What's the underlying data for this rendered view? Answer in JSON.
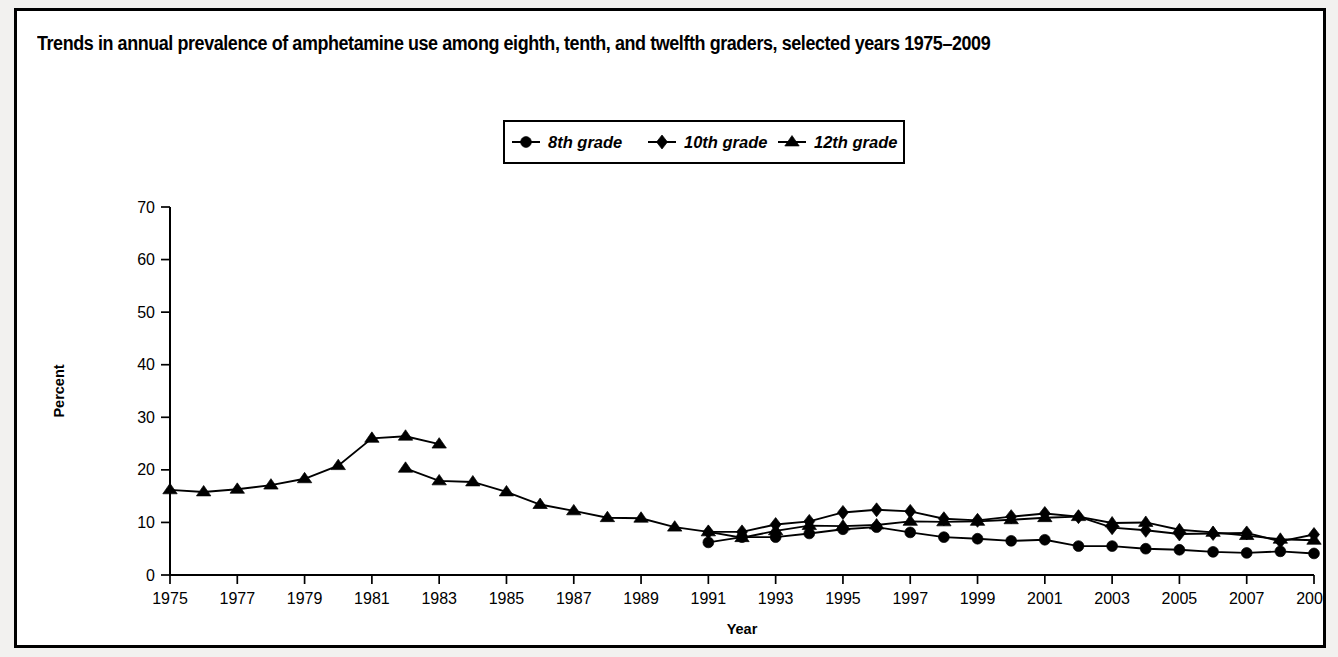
{
  "figure": {
    "title": "Trends in annual prevalence of amphetamine use among eighth, tenth, and twelfth graders, selected years 1975–2009",
    "frame_color": "#000000",
    "background_color": "#ffffff"
  },
  "legend": {
    "position": "top-center",
    "entries": [
      {
        "label": "8th grade",
        "marker": "circle"
      },
      {
        "label": "10th grade",
        "marker": "diamond"
      },
      {
        "label": "12th grade",
        "marker": "triangle"
      }
    ]
  },
  "chart_data": {
    "type": "line",
    "title": "Trends in annual prevalence of amphetamine use among eighth, tenth, and twelfth graders, selected years 1975–2009",
    "xlabel": "Year",
    "ylabel": "Percent",
    "xlim": [
      1975,
      2009
    ],
    "ylim": [
      0,
      70
    ],
    "ytick_step": 10,
    "yticks": [
      0,
      10,
      20,
      30,
      40,
      50,
      60,
      70
    ],
    "xticks": [
      1975,
      1977,
      1979,
      1981,
      1983,
      1985,
      1987,
      1989,
      1991,
      1993,
      1995,
      1997,
      1999,
      2001,
      2003,
      2005,
      2007,
      2009
    ],
    "xtick_labels": [
      "1975",
      "1977",
      "1979",
      "1981",
      "1983",
      "1985",
      "1987",
      "1989",
      "1991",
      "1993",
      "1995",
      "1997",
      "1999",
      "2001",
      "2003",
      "2005",
      "2007",
      "2009"
    ],
    "grid": false,
    "series": [
      {
        "name": "8th grade",
        "marker": "circle",
        "x": [
          1991,
          1992,
          1993,
          1994,
          1995,
          1996,
          1997,
          1998,
          1999,
          2000,
          2001,
          2002,
          2003,
          2004,
          2005,
          2006,
          2007,
          2008,
          2009
        ],
        "values": [
          6.2,
          7.2,
          7.2,
          7.9,
          8.7,
          9.1,
          8.1,
          7.2,
          6.9,
          6.5,
          6.7,
          5.5,
          5.5,
          5.0,
          4.8,
          4.4,
          4.2,
          4.5,
          4.1
        ]
      },
      {
        "name": "10th grade",
        "marker": "diamond",
        "x": [
          1991,
          1992,
          1993,
          1994,
          1995,
          1996,
          1997,
          1998,
          1999,
          2000,
          2001,
          2002,
          2003,
          2004,
          2005,
          2006,
          2007,
          2008,
          2009
        ],
        "values": [
          8.2,
          8.2,
          9.6,
          10.2,
          11.9,
          12.4,
          12.1,
          10.7,
          10.4,
          11.1,
          11.7,
          11.1,
          9.0,
          8.5,
          7.8,
          7.9,
          8.0,
          6.4,
          7.7
        ]
      },
      {
        "name": "12th grade",
        "marker": "triangle",
        "segment": "1975-1983 (original question wording)",
        "x": [
          1975,
          1976,
          1977,
          1978,
          1979,
          1980,
          1981,
          1982,
          1983
        ],
        "values": [
          16.2,
          15.8,
          16.3,
          17.1,
          18.3,
          20.8,
          26.0,
          26.4,
          24.9
        ]
      },
      {
        "name": "12th grade",
        "marker": "triangle",
        "segment": "1982-2009 (revised question wording)",
        "x": [
          1982,
          1983,
          1984,
          1985,
          1986,
          1987,
          1988,
          1989,
          1990,
          1991,
          1992,
          1993,
          1994,
          1995,
          1996,
          1997,
          1998,
          1999,
          2000,
          2001,
          2002,
          2003,
          2004,
          2005,
          2006,
          2007,
          2008,
          2009
        ],
        "values": [
          20.3,
          17.9,
          17.7,
          15.8,
          13.4,
          12.2,
          10.9,
          10.8,
          9.1,
          8.2,
          7.1,
          8.4,
          9.4,
          9.3,
          9.5,
          10.2,
          10.1,
          10.2,
          10.5,
          10.9,
          11.1,
          9.9,
          10.0,
          8.6,
          8.1,
          7.5,
          6.8,
          6.6
        ]
      }
    ]
  }
}
